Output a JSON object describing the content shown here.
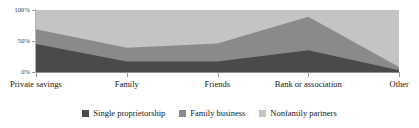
{
  "chart_data": {
    "type": "area",
    "stacked": true,
    "stacked_mode": "percent",
    "title": "",
    "subtitle": "",
    "xlabel": "",
    "ylabel": "",
    "categories": [
      "Private savings",
      "Family",
      "Friends",
      "Bank or association",
      "Other"
    ],
    "ylim": [
      0,
      100
    ],
    "yticks": [
      0,
      50,
      100
    ],
    "ytick_labels": [
      "0%",
      "50%",
      "100%"
    ],
    "grid": false,
    "legend_position": "bottom",
    "series": [
      {
        "name": "Single proprietorship",
        "color": "#4a4a4a",
        "values": [
          45,
          17,
          17,
          35,
          3
        ]
      },
      {
        "name": "Family business",
        "color": "#8a8a8a",
        "values": [
          24,
          22,
          29,
          54,
          5
        ]
      },
      {
        "name": "Nonfamily partners",
        "color": "#c4c4c4",
        "values": [
          31,
          61,
          54,
          11,
          92
        ]
      }
    ],
    "cumulative_tops": [
      [
        45,
        17,
        17,
        35,
        3
      ],
      [
        69,
        39,
        46,
        89,
        8
      ],
      [
        100,
        100,
        100,
        100,
        100
      ]
    ]
  },
  "axes": {
    "y": {
      "ticks": [
        {
          "label": "100%",
          "value": 100
        },
        {
          "label": "50%",
          "value": 50
        },
        {
          "label": "0%",
          "value": 0
        }
      ]
    },
    "x": {
      "ticks": [
        {
          "label": "Private savings",
          "value": 0
        },
        {
          "label": "Family",
          "value": 1
        },
        {
          "label": "Friends",
          "value": 2
        },
        {
          "label": "Bank or association",
          "value": 3
        },
        {
          "label": "Other",
          "value": 4
        }
      ]
    }
  },
  "legend": {
    "items": [
      {
        "label": "Single proprietorship",
        "color": "#4a4a4a",
        "swatch": "square-swatch"
      },
      {
        "label": "Family business",
        "color": "#8a8a8a",
        "swatch": "square-swatch"
      },
      {
        "label": "Nonfamily partners",
        "color": "#c4c4c4",
        "swatch": "square-swatch"
      }
    ]
  }
}
